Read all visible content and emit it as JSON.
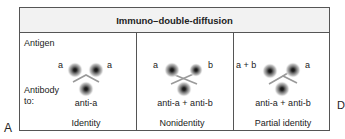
{
  "title": "Immuno–double-diffusion",
  "figure_label": "A",
  "cut_off_label": "D",
  "row_labels": {
    "antigen": "Antigen",
    "antibody_line1": "Antibody",
    "antibody_line2": "to:"
  },
  "panels": [
    {
      "name": "Identity",
      "antigen_left": "a",
      "antigen_right": "a",
      "antibody": "anti-a",
      "caption": "Identity",
      "precipitin_pattern": "fused arc"
    },
    {
      "name": "Nonidentity",
      "antigen_left": "a",
      "antigen_right": "b",
      "antibody": "anti-a + anti-b",
      "caption": "Nonidentity",
      "precipitin_pattern": "crossed lines"
    },
    {
      "name": "Partial identity",
      "antigen_left": "a + b",
      "antigen_right": "a",
      "antibody": "anti-a + anti-b",
      "caption": "Partial identity",
      "precipitin_pattern": "arc with spur"
    }
  ],
  "colors": {
    "border": "#555555",
    "header_bg": "#f2f2f2",
    "precipitin_line": "#9a9a9a",
    "well": "#222222"
  }
}
